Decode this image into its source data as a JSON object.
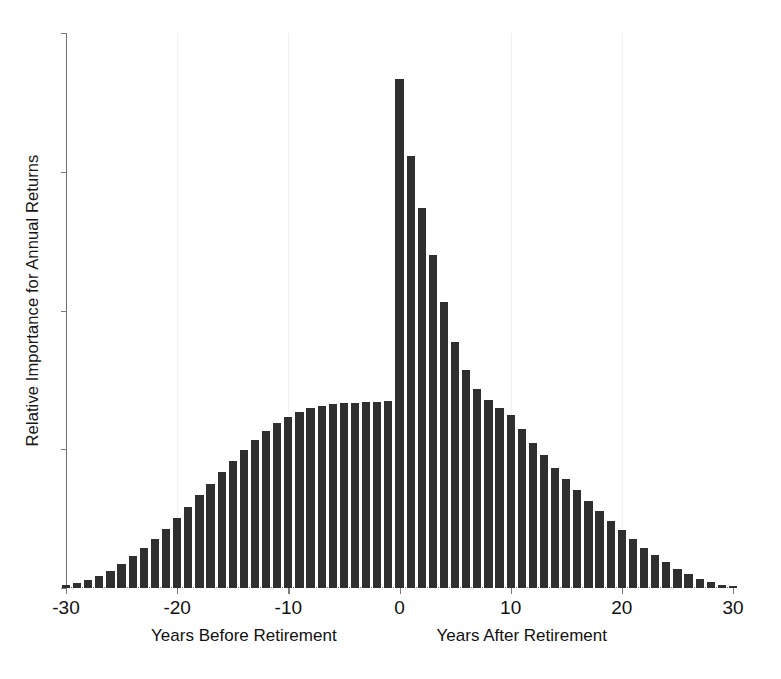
{
  "chart_data": {
    "type": "bar",
    "title": "",
    "xlabel": "Years Before Retirement / Years After Retirement",
    "ylabel": "Relative Importance for Annual Returns",
    "xlim": [
      -30,
      30
    ],
    "ylim": [
      0,
      1.0
    ],
    "grid": false,
    "legend": null,
    "bar_color": "#2f2f2f",
    "axis_color": "#6f6f6f",
    "xticks": [
      -30,
      -20,
      -10,
      0,
      10,
      20,
      30
    ],
    "xticklabels": [
      "-30",
      "-20",
      "-10",
      "0",
      "10",
      "20",
      "30"
    ],
    "yticklabels": [],
    "annotations": [
      {
        "text": "Years Before Retirement",
        "x": -14
      },
      {
        "text": "Years After Retirement",
        "x": 11
      }
    ],
    "x": [
      -30,
      -29,
      -28,
      -27,
      -26,
      -25,
      -24,
      -23,
      -22,
      -21,
      -20,
      -19,
      -18,
      -17,
      -16,
      -15,
      -14,
      -13,
      -12,
      -11,
      -10,
      -9,
      -8,
      -7,
      -6,
      -5,
      -4,
      -3,
      -2,
      -1,
      0,
      1,
      2,
      3,
      4,
      5,
      6,
      7,
      8,
      9,
      10,
      11,
      12,
      13,
      14,
      15,
      16,
      17,
      18,
      19,
      20,
      21,
      22,
      23,
      24,
      25,
      26,
      27,
      28,
      29,
      30
    ],
    "values": [
      0.005,
      0.009,
      0.014,
      0.022,
      0.031,
      0.043,
      0.057,
      0.072,
      0.089,
      0.107,
      0.126,
      0.146,
      0.167,
      0.188,
      0.209,
      0.229,
      0.249,
      0.267,
      0.283,
      0.297,
      0.309,
      0.318,
      0.324,
      0.328,
      0.331,
      0.333,
      0.334,
      0.335,
      0.336,
      0.337,
      0.917,
      0.779,
      0.684,
      0.6,
      0.516,
      0.443,
      0.393,
      0.358,
      0.339,
      0.325,
      0.311,
      0.286,
      0.262,
      0.239,
      0.217,
      0.196,
      0.176,
      0.157,
      0.139,
      0.121,
      0.104,
      0.088,
      0.073,
      0.059,
      0.046,
      0.035,
      0.025,
      0.017,
      0.011,
      0.006,
      0.003
    ]
  },
  "axes": {
    "ylabel_text": "Relative Importance for Annual Returns",
    "sublabel_before": "Years Before Retirement",
    "sublabel_after": "Years After Retirement"
  }
}
